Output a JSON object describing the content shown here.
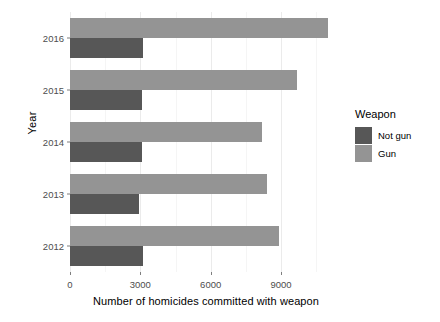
{
  "chart_data": {
    "type": "bar",
    "orientation": "horizontal",
    "title": "",
    "xlabel": "Number of homicides committed with weapon",
    "ylabel": "Year",
    "categories": [
      "2016",
      "2015",
      "2014",
      "2013",
      "2012"
    ],
    "series": [
      {
        "name": "Not gun",
        "color": "#575757",
        "values": [
          3100,
          3050,
          3050,
          2950,
          3100
        ]
      },
      {
        "name": "Gun",
        "color": "#949494",
        "values": [
          11000,
          9700,
          8200,
          8400,
          8900
        ]
      }
    ],
    "xlim": [
      0,
      11600
    ],
    "xticks": [
      0,
      3000,
      6000,
      9000
    ],
    "xtick_labels": [
      "0",
      "3000",
      "6000",
      "9000"
    ],
    "ytick_labels": [
      "2016",
      "2015",
      "2014",
      "2013",
      "2012"
    ],
    "grid": true,
    "grid_minor_ticks": [
      1500,
      4500,
      7500,
      10500
    ],
    "legend": {
      "title": "Weapon",
      "position": "right",
      "entries": [
        {
          "label": "Not gun",
          "color": "#575757"
        },
        {
          "label": "Gun",
          "color": "#949494"
        }
      ]
    },
    "panel_background": "#ffffff",
    "grid_color": "#ebebeb"
  }
}
